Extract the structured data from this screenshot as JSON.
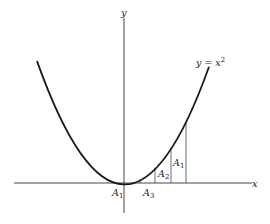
{
  "diagram": {
    "curve_label": "y = x",
    "curve_exponent": "2",
    "axes": {
      "x_label": "x",
      "y_label": "y"
    },
    "area_labels": [
      {
        "id": "A1_origin",
        "letter": "A",
        "sub": "1"
      },
      {
        "id": "A3",
        "letter": "A",
        "sub": "3"
      },
      {
        "id": "A2",
        "letter": "A",
        "sub": "2"
      },
      {
        "id": "A1_right",
        "letter": "A",
        "sub": "1"
      }
    ],
    "colors": {
      "curve": "#1a1a1a",
      "axis": "#333333",
      "lines": "#444444"
    }
  }
}
